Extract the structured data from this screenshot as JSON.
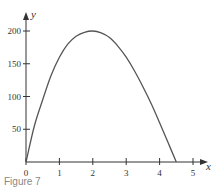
{
  "chart_data": {
    "type": "line",
    "title": "",
    "xlabel": "x",
    "ylabel": "y",
    "xlim": [
      0,
      5.3
    ],
    "ylim": [
      0,
      215
    ],
    "grid": false,
    "legend": null,
    "x_ticks": [
      0,
      1,
      2,
      3,
      4,
      5
    ],
    "y_ticks": [
      50,
      100,
      150,
      200
    ],
    "x_tick_labels": [
      "0",
      "1",
      "2",
      "3",
      "4",
      "5"
    ],
    "y_tick_labels": [
      "50",
      "100",
      "150",
      "200"
    ],
    "series": [
      {
        "name": "y",
        "x": [
          0,
          0.25,
          0.5,
          0.75,
          1,
          1.25,
          1.5,
          1.75,
          2,
          2.25,
          2.5,
          2.75,
          3,
          3.25,
          3.5,
          3.75,
          4,
          4.25,
          4.5
        ],
        "values": [
          0,
          55,
          95,
          132,
          160,
          180,
          192,
          198,
          200,
          197,
          190,
          177,
          160,
          139,
          115,
          89,
          60,
          30,
          0
        ]
      }
    ]
  },
  "caption": "Figure 7"
}
